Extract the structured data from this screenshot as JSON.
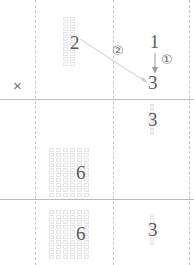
{
  "document": {
    "title": "Column multiplication worked example",
    "kind": "math-worksheet"
  },
  "colors": {
    "grid_line": "#e4e4ea",
    "grid_fill": "#fbfbfc",
    "rule_dashed": "#c9b7c6",
    "rule_solid": "#b9b9b9",
    "digit_faint": "#8e8e93",
    "digit_dark": "#58585c",
    "digit_vfaint": "#c3c3c8",
    "annotation": "#6a6a70",
    "connector": "#d8d8de"
  },
  "operator": {
    "multiply_symbol": "×"
  },
  "steps": [
    {
      "id": "step-1",
      "marker": "①",
      "label": "1"
    },
    {
      "id": "step-2",
      "marker": "②",
      "label": "2"
    }
  ],
  "rows": [
    {
      "id": "row-multiplicand",
      "tens": {
        "digit": "2",
        "blocks": 2,
        "block_rows": 10
      },
      "ones": {
        "digit": "3",
        "blocks": 0,
        "block_rows": 0
      }
    },
    {
      "id": "row-partial-ones",
      "tens": {
        "digit": "",
        "blocks": 0,
        "block_rows": 0
      },
      "ones": {
        "digit": "3",
        "blocks": 1,
        "block_rows": 8
      }
    },
    {
      "id": "row-partial-tens",
      "tens": {
        "digit": "6",
        "blocks": 6,
        "block_rows": 10
      },
      "ones": {
        "digit": "",
        "blocks": 0,
        "block_rows": 0
      }
    },
    {
      "id": "row-product",
      "tens": {
        "digit": "6",
        "blocks": 6,
        "block_rows": 10
      },
      "ones": {
        "digit": "3",
        "blocks": 1,
        "block_rows": 8
      }
    }
  ],
  "annotations": {
    "multiplier_top": "1",
    "arrow_target": "3",
    "carry_note": ""
  }
}
